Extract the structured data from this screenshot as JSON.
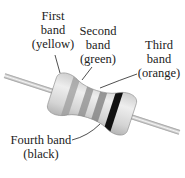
{
  "labels": {
    "first": {
      "lines": [
        "First",
        "band",
        "(yellow)"
      ]
    },
    "second": {
      "lines": [
        "Second",
        "band",
        "(green)"
      ]
    },
    "third": {
      "lines": [
        "Third",
        "band",
        "(orange)"
      ]
    },
    "fourth": {
      "lines": [
        "Fourth band",
        "(black)"
      ]
    }
  },
  "colors": {
    "body": "#d8d8d8",
    "band1": "#a8a8a8",
    "band2": "#9a9a9a",
    "band3": "#8e8e8e",
    "band4": "#111111",
    "lead": "#c8c8c8"
  }
}
